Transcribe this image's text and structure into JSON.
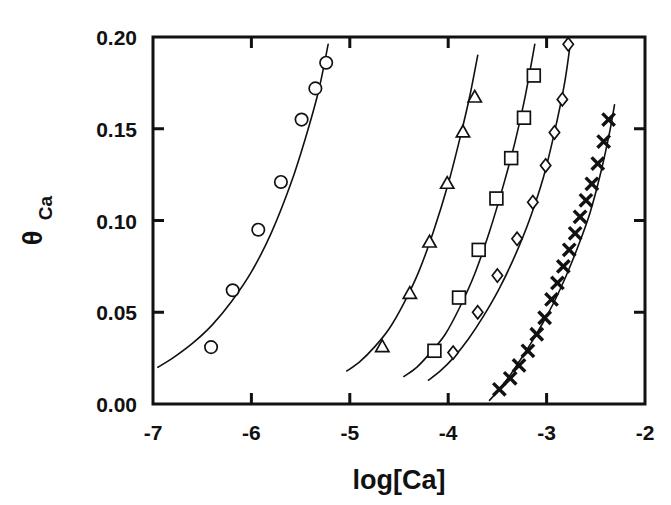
{
  "figure": {
    "background_color": "#ffffff",
    "foreground_color": "#111111",
    "width": 671,
    "height": 505
  },
  "axes": {
    "x_title": "log[Ca]",
    "y_title_symbol": "θ",
    "y_title_subscript": "Ca",
    "x_tick_labels": [
      "-7",
      "-6",
      "-5",
      "-4",
      "-3",
      "-2"
    ],
    "y_tick_labels": [
      "0.00",
      "0.05",
      "0.10",
      "0.15",
      "0.20"
    ]
  },
  "chart_data": {
    "type": "scatter",
    "title": "",
    "subtitle": "",
    "xlabel": "log[Ca]",
    "ylabel": "θ_Ca",
    "xlim": [
      -7,
      -2
    ],
    "ylim": [
      0.0,
      0.2
    ],
    "xticks": [
      -7,
      -6,
      -5,
      -4,
      -3,
      -2
    ],
    "yticks": [
      0.0,
      0.05,
      0.1,
      0.15,
      0.2
    ],
    "xticklabels": [
      "-7",
      "-6",
      "-5",
      "-4",
      "-3",
      "-2"
    ],
    "yticklabels": [
      "0.00",
      "0.05",
      "0.10",
      "0.15",
      "0.20"
    ],
    "grid": false,
    "legend": "none",
    "legend_position": "none",
    "annotations": [],
    "series": [
      {
        "name": "series-1",
        "marker": "circle",
        "fit_line": true,
        "x": [
          -6.41,
          -6.19,
          -5.93,
          -5.7,
          -5.49,
          -5.35,
          -5.24
        ],
        "y": [
          0.031,
          0.062,
          0.095,
          0.121,
          0.155,
          0.172,
          0.186
        ],
        "fit_x": [
          -6.95,
          -6.8,
          -6.6,
          -6.4,
          -6.2,
          -6.0,
          -5.8,
          -5.6,
          -5.45,
          -5.32,
          -5.22
        ],
        "fit_y": [
          0.02,
          0.025,
          0.033,
          0.043,
          0.056,
          0.072,
          0.093,
          0.12,
          0.145,
          0.17,
          0.196
        ]
      },
      {
        "name": "series-2",
        "marker": "triangle",
        "fit_line": true,
        "x": [
          -4.67,
          -4.39,
          -4.19,
          -4.01,
          -3.85,
          -3.73
        ],
        "y": [
          0.031,
          0.06,
          0.088,
          0.12,
          0.148,
          0.167
        ],
        "fit_x": [
          -5.03,
          -4.9,
          -4.75,
          -4.6,
          -4.45,
          -4.3,
          -4.15,
          -4.0,
          -3.88,
          -3.78,
          -3.7
        ],
        "fit_y": [
          0.018,
          0.023,
          0.031,
          0.041,
          0.055,
          0.072,
          0.094,
          0.12,
          0.145,
          0.168,
          0.19
        ]
      },
      {
        "name": "series-3",
        "marker": "square",
        "fit_line": true,
        "x": [
          -4.14,
          -3.89,
          -3.69,
          -3.51,
          -3.36,
          -3.23,
          -3.13
        ],
        "y": [
          0.029,
          0.058,
          0.084,
          0.112,
          0.134,
          0.156,
          0.179
        ],
        "fit_x": [
          -4.45,
          -4.32,
          -4.18,
          -4.03,
          -3.88,
          -3.73,
          -3.58,
          -3.44,
          -3.32,
          -3.22,
          -3.12
        ],
        "fit_y": [
          0.015,
          0.02,
          0.028,
          0.038,
          0.053,
          0.071,
          0.094,
          0.119,
          0.143,
          0.167,
          0.196
        ]
      },
      {
        "name": "series-4",
        "marker": "diamond",
        "fit_line": true,
        "x": [
          -3.95,
          -3.7,
          -3.5,
          -3.3,
          -3.14,
          -3.01,
          -2.92,
          -2.84,
          -2.78
        ],
        "y": [
          0.028,
          0.05,
          0.07,
          0.09,
          0.11,
          0.13,
          0.148,
          0.166,
          0.196
        ],
        "fit_x": [
          -4.2,
          -4.08,
          -3.95,
          -3.8,
          -3.64,
          -3.48,
          -3.32,
          -3.17,
          -3.03,
          -2.92,
          -2.82,
          -2.76
        ],
        "fit_y": [
          0.013,
          0.018,
          0.025,
          0.035,
          0.048,
          0.063,
          0.081,
          0.101,
          0.124,
          0.148,
          0.174,
          0.196
        ]
      },
      {
        "name": "series-5",
        "marker": "cross",
        "fit_line": true,
        "x": [
          -3.48,
          -3.37,
          -3.28,
          -3.19,
          -3.1,
          -3.02,
          -2.95,
          -2.89,
          -2.83,
          -2.77,
          -2.71,
          -2.66,
          -2.6,
          -2.54,
          -2.48,
          -2.42,
          -2.37
        ],
        "y": [
          0.008,
          0.014,
          0.021,
          0.029,
          0.038,
          0.047,
          0.057,
          0.066,
          0.075,
          0.084,
          0.093,
          0.102,
          0.111,
          0.12,
          0.131,
          0.143,
          0.155
        ],
        "fit_x": [
          -3.58,
          -3.48,
          -3.38,
          -3.28,
          -3.16,
          -3.04,
          -2.92,
          -2.8,
          -2.68,
          -2.56,
          -2.45,
          -2.36,
          -2.31
        ],
        "fit_y": [
          0.002,
          0.008,
          0.015,
          0.023,
          0.033,
          0.044,
          0.056,
          0.07,
          0.086,
          0.104,
          0.126,
          0.148,
          0.163
        ]
      }
    ]
  }
}
